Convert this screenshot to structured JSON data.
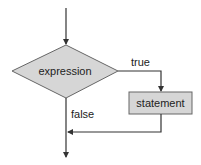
{
  "diagram": {
    "type": "flowchart",
    "nodes": {
      "decision": {
        "label": "expression",
        "shape": "diamond",
        "fill": "#d6d6d6"
      },
      "action": {
        "label": "statement",
        "shape": "rectangle",
        "fill": "#d6d6d6"
      }
    },
    "edges": {
      "true_label": "true",
      "false_label": "false"
    },
    "colors": {
      "line": "#333333",
      "shape_fill": "#d6d6d6",
      "shape_stroke": "#555555"
    }
  }
}
